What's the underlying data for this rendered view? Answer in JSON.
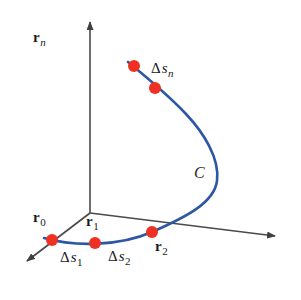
{
  "figure": {
    "background_color": "#ffffff",
    "curve_color": "#2b57a5",
    "point_color": "#ee3123",
    "axis_color": "#4a4a4a",
    "label_color": "#1a1a1a"
  },
  "axes": [
    {
      "name": "vertical-axis",
      "from": [
        90,
        213
      ],
      "to": [
        90,
        18
      ]
    },
    {
      "name": "right-axis",
      "from": [
        90,
        213
      ],
      "to": [
        281,
        237
      ]
    },
    {
      "name": "front-left-axis",
      "from": [
        90,
        213
      ],
      "to": [
        22,
        265
      ]
    }
  ],
  "curve": {
    "name": "C",
    "label": "C",
    "label_position": [
      198,
      174
    ],
    "color": "#2b57a5"
  },
  "points": [
    {
      "name": "point-r0",
      "x": 52,
      "y": 240
    },
    {
      "name": "point-r1",
      "x": 95,
      "y": 243
    },
    {
      "name": "point-r2",
      "x": 152,
      "y": 232
    },
    {
      "name": "point-rn-next",
      "x": 155,
      "y": 88
    },
    {
      "name": "point-rn",
      "x": 134,
      "y": 66
    }
  ],
  "labels": {
    "r0": {
      "symbol": "r",
      "subscript": "0",
      "x": 33,
      "y": 210
    },
    "r1": {
      "symbol": "r",
      "subscript": "1",
      "x": 86,
      "y": 214
    },
    "r2": {
      "symbol": "r",
      "subscript": "2",
      "x": 155,
      "y": 239
    },
    "rn": {
      "symbol": "r",
      "subscript": "n",
      "x": 114,
      "y": 30
    },
    "ds1": {
      "delta": "Δ",
      "variable": "s",
      "subscript": "1",
      "x": 60,
      "y": 250
    },
    "ds2": {
      "delta": "Δ",
      "variable": "s",
      "subscript": "2",
      "x": 108,
      "y": 249
    },
    "dsn": {
      "delta": "Δ",
      "variable": "s",
      "subscript": "n",
      "x": 151,
      "y": 61
    }
  }
}
